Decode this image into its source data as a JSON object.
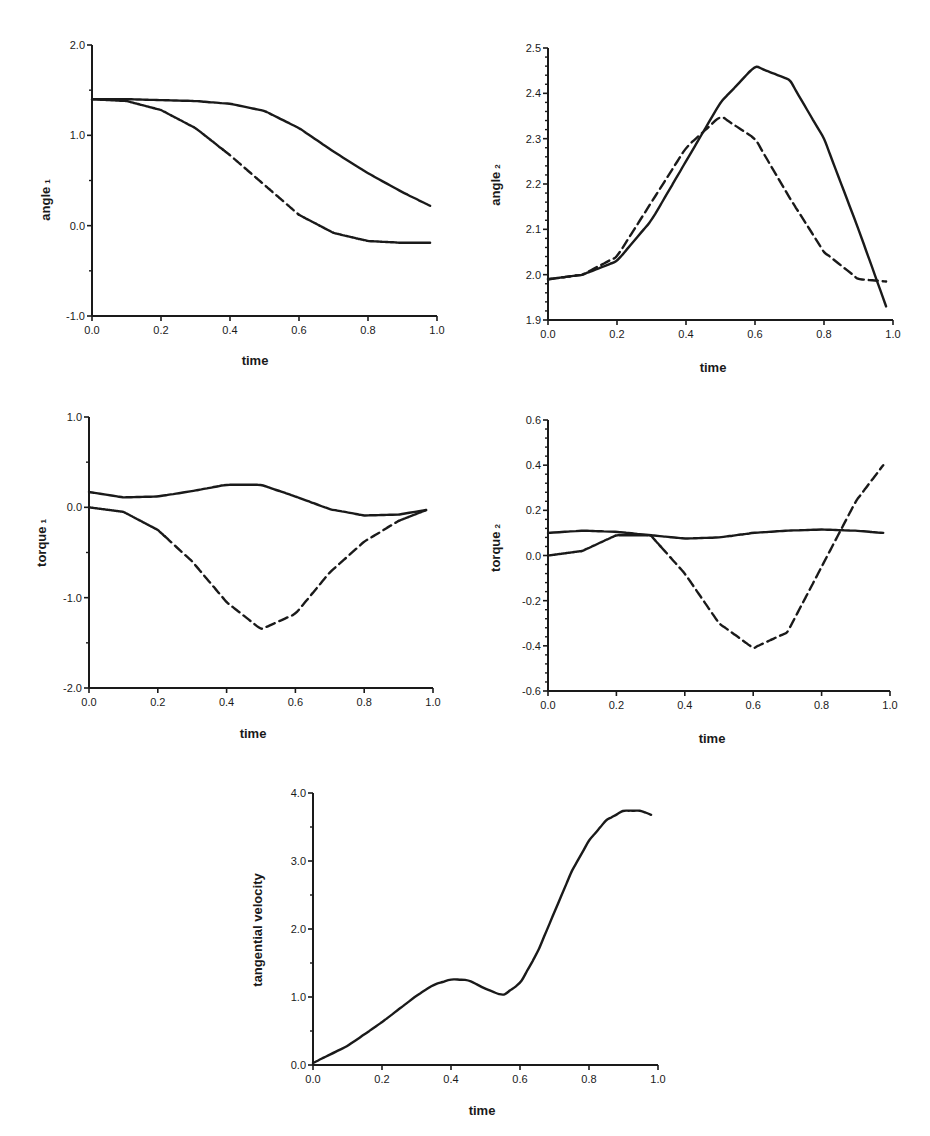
{
  "chart_data": [
    {
      "id": "angle1",
      "type": "line",
      "title": "",
      "xlabel": "time",
      "ylabel": "angle",
      "ylabel_subscript": "1",
      "xlim": [
        0.0,
        1.0
      ],
      "ylim": [
        -1.0,
        2.0
      ],
      "xticks": [
        "0.0",
        "0.2",
        "0.4",
        "0.6",
        "0.8",
        "1.0"
      ],
      "yticks": [
        "-1.0",
        "0.0",
        "1.0",
        "2.0"
      ],
      "grid": false,
      "legend": null,
      "x": [
        0.0,
        0.1,
        0.2,
        0.3,
        0.4,
        0.5,
        0.6,
        0.7,
        0.8,
        0.9,
        0.98
      ],
      "series": [
        {
          "name": "curve A (solid)",
          "style": "solid",
          "values": [
            1.4,
            1.4,
            1.39,
            1.38,
            1.35,
            1.27,
            1.08,
            0.82,
            0.58,
            0.37,
            0.22
          ]
        },
        {
          "name": "curve B (solid, dashed in mid-section)",
          "style": "mixed",
          "dashed_range": [
            0.38,
            0.6
          ],
          "values": [
            1.4,
            1.38,
            1.28,
            1.08,
            0.78,
            0.45,
            0.12,
            -0.08,
            -0.17,
            -0.19,
            -0.19
          ]
        }
      ]
    },
    {
      "id": "angle2",
      "type": "line",
      "title": "",
      "xlabel": "time",
      "ylabel": "angle",
      "ylabel_subscript": "2",
      "xlim": [
        0.0,
        1.0
      ],
      "ylim": [
        1.9,
        2.5
      ],
      "xticks": [
        "0.0",
        "0.2",
        "0.4",
        "0.6",
        "0.8",
        "1.0"
      ],
      "yticks": [
        "1.9",
        "2.0",
        "2.1",
        "2.2",
        "2.3",
        "2.4",
        "2.5"
      ],
      "grid": false,
      "legend": null,
      "x": [
        0.0,
        0.1,
        0.2,
        0.3,
        0.4,
        0.5,
        0.6,
        0.7,
        0.8,
        0.9,
        0.98
      ],
      "series": [
        {
          "name": "solid",
          "style": "solid",
          "values": [
            1.99,
            2.0,
            2.03,
            2.12,
            2.25,
            2.38,
            2.46,
            2.43,
            2.3,
            2.1,
            1.93
          ]
        },
        {
          "name": "dashed",
          "style": "dashed",
          "values": [
            1.99,
            2.0,
            2.04,
            2.16,
            2.28,
            2.35,
            2.3,
            2.17,
            2.05,
            1.99,
            1.985
          ]
        }
      ]
    },
    {
      "id": "torque1",
      "type": "line",
      "title": "",
      "xlabel": "time",
      "ylabel": "torque",
      "ylabel_subscript": "1",
      "xlim": [
        0.0,
        1.0
      ],
      "ylim": [
        -2.0,
        1.0
      ],
      "xticks": [
        "0.0",
        "0.2",
        "0.4",
        "0.6",
        "0.8",
        "1.0"
      ],
      "yticks": [
        "-2.0",
        "-1.0",
        "0.0",
        "1.0"
      ],
      "grid": false,
      "legend": null,
      "x": [
        0.0,
        0.1,
        0.2,
        0.3,
        0.4,
        0.5,
        0.6,
        0.7,
        0.8,
        0.9,
        0.98
      ],
      "series": [
        {
          "name": "solid",
          "style": "solid",
          "values": [
            0.17,
            0.11,
            0.12,
            0.18,
            0.25,
            0.25,
            0.12,
            -0.02,
            -0.09,
            -0.08,
            -0.03
          ]
        },
        {
          "name": "dashed",
          "style": "mixed",
          "dashed_range": [
            0.22,
            0.9
          ],
          "values": [
            0.0,
            -0.05,
            -0.25,
            -0.6,
            -1.05,
            -1.35,
            -1.18,
            -0.72,
            -0.38,
            -0.15,
            -0.03
          ]
        }
      ]
    },
    {
      "id": "torque2",
      "type": "line",
      "title": "",
      "xlabel": "time",
      "ylabel": "torque",
      "ylabel_subscript": "2",
      "xlim": [
        0.0,
        1.0
      ],
      "ylim": [
        -0.6,
        0.6
      ],
      "xticks": [
        "0.0",
        "0.2",
        "0.4",
        "0.6",
        "0.8",
        "1.0"
      ],
      "yticks": [
        "-0.6",
        "-0.4",
        "-0.2",
        "0.0",
        "0.2",
        "0.4",
        "0.6"
      ],
      "grid": false,
      "legend": null,
      "x": [
        0.0,
        0.1,
        0.2,
        0.3,
        0.4,
        0.5,
        0.6,
        0.7,
        0.8,
        0.9,
        0.98
      ],
      "series": [
        {
          "name": "solid",
          "style": "solid",
          "values": [
            0.1,
            0.11,
            0.105,
            0.09,
            0.075,
            0.08,
            0.1,
            0.11,
            0.115,
            0.11,
            0.1
          ]
        },
        {
          "name": "dashed",
          "style": "mixed",
          "dashed_range": [
            0.33,
            1.0
          ],
          "values": [
            0.0,
            0.02,
            0.09,
            0.09,
            -0.08,
            -0.3,
            -0.41,
            -0.34,
            -0.05,
            0.24,
            0.4
          ]
        }
      ]
    },
    {
      "id": "tangential_velocity",
      "type": "line",
      "title": "",
      "xlabel": "time",
      "ylabel": "tangential velocity",
      "ylabel_subscript": "",
      "xlim": [
        0.0,
        1.0
      ],
      "ylim": [
        0.0,
        4.0
      ],
      "xticks": [
        "0.0",
        "0.2",
        "0.4",
        "0.6",
        "0.8",
        "1.0"
      ],
      "yticks": [
        "0.0",
        "1.0",
        "2.0",
        "3.0",
        "4.0"
      ],
      "grid": false,
      "legend": null,
      "x": [
        0.0,
        0.1,
        0.2,
        0.3,
        0.35,
        0.4,
        0.45,
        0.5,
        0.55,
        0.6,
        0.65,
        0.7,
        0.75,
        0.8,
        0.85,
        0.9,
        0.95,
        0.98
      ],
      "series": [
        {
          "name": "velocity",
          "style": "solid",
          "values": [
            0.03,
            0.28,
            0.63,
            1.02,
            1.18,
            1.26,
            1.25,
            1.12,
            1.02,
            1.2,
            1.65,
            2.25,
            2.85,
            3.3,
            3.6,
            3.74,
            3.74,
            3.68
          ]
        }
      ]
    }
  ],
  "panels": [
    {
      "ylabel": "angle",
      "sub": "1",
      "xlabel": "time"
    },
    {
      "ylabel": "angle",
      "sub": "2",
      "xlabel": "time"
    },
    {
      "ylabel": "torque",
      "sub": "1",
      "xlabel": "time"
    },
    {
      "ylabel": "torque",
      "sub": "2",
      "xlabel": "time"
    },
    {
      "ylabel": "tangential velocity",
      "sub": "",
      "xlabel": "time"
    }
  ]
}
